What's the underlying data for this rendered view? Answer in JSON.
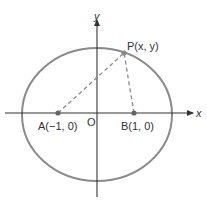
{
  "diagram": {
    "type": "ellipse-with-foci",
    "axes": {
      "x_label": "x",
      "y_label": "y",
      "origin_label": "O"
    },
    "points": {
      "A": {
        "label": "A(−1, 0)",
        "coords": [
          -1,
          0
        ]
      },
      "B": {
        "label": "B(1, 0)",
        "coords": [
          1,
          0
        ]
      },
      "P": {
        "label": "P(x, y)",
        "coords": [
          "x",
          "y"
        ]
      }
    },
    "segments": [
      {
        "from": "A",
        "to": "P",
        "style": "dashed"
      },
      {
        "from": "B",
        "to": "P",
        "style": "dashed"
      }
    ],
    "colors": {
      "ellipse": "#8a8a8a",
      "axes": "#333333",
      "dashed": "#8a8a8a",
      "points": "#666666",
      "text": "#333333"
    }
  }
}
